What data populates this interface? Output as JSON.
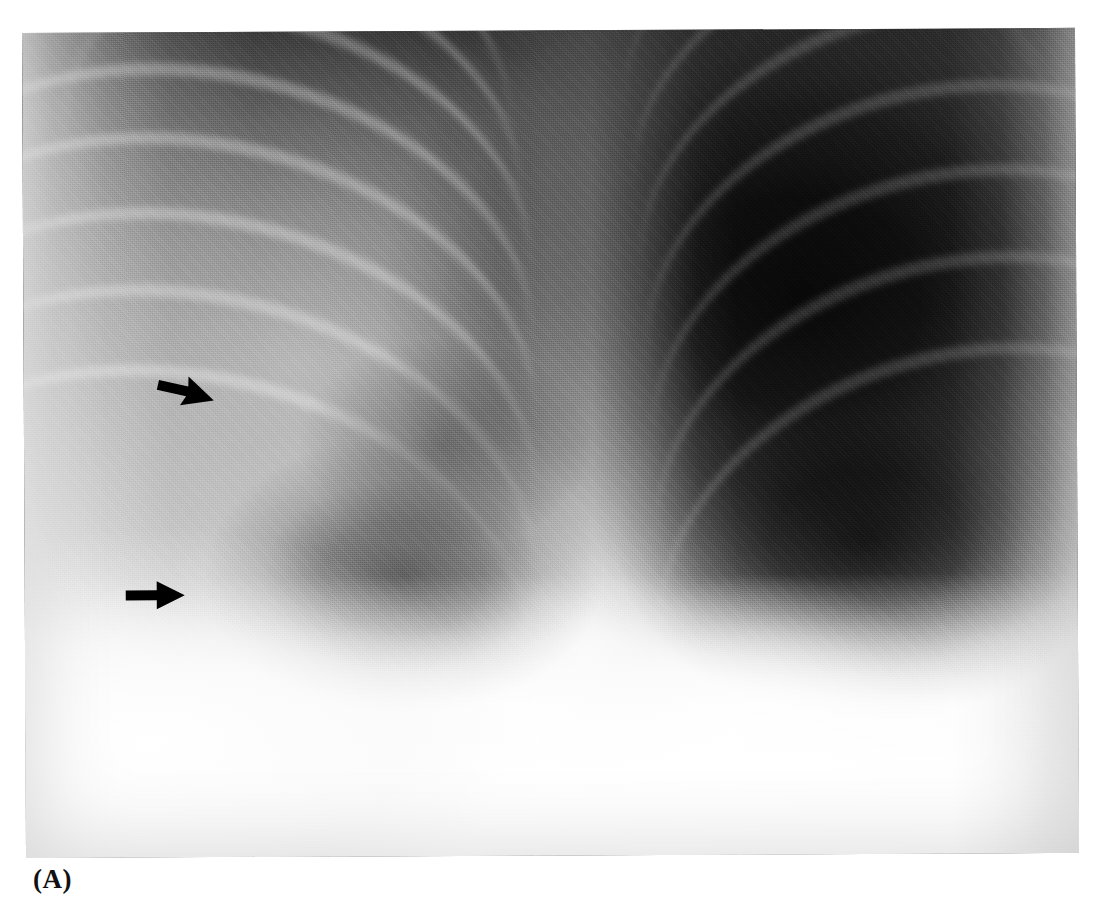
{
  "figure": {
    "panel_label": "(A)",
    "modality": "chest-radiograph",
    "view": "frontal-pa-coned"
  },
  "image_plate": {
    "left": 22,
    "top": 33,
    "width": 1053,
    "height": 825,
    "rotation_deg": -0.28,
    "background": "#585858"
  },
  "tones": {
    "film_white": "#ffffff",
    "page_background": "#ffffff",
    "apex_dark": "#3a3a3a",
    "hyperlucent_lung": "#050505",
    "mediastinum_bright": "#f2f2f2",
    "diaphragm_white": "#fbfbfb",
    "annotation_black": "#000000",
    "caption_color": "#111111"
  },
  "annotations": {
    "arrows": [
      {
        "name": "upper-arrow",
        "label": "upper annotation arrow",
        "direction": "right-down",
        "x": 152,
        "y": 380,
        "width": 56,
        "height": 34,
        "angle_deg": 14,
        "color": "#000000"
      },
      {
        "name": "lower-arrow",
        "label": "lower annotation arrow",
        "direction": "right",
        "x": 121,
        "y": 585,
        "width": 58,
        "height": 26,
        "angle_deg": 0,
        "color": "#000000"
      }
    ]
  },
  "anatomy_regions": [
    {
      "name": "right-lung-field",
      "side": "image-left",
      "density": "normal-to-increased"
    },
    {
      "name": "left-lung-field",
      "side": "image-right",
      "density": "markedly-hyperlucent"
    },
    {
      "name": "mediastinum-and-spine",
      "side": "centre",
      "density": "opaque-bright"
    },
    {
      "name": "cardiac-silhouette",
      "side": "image-centre-left",
      "density": "soft-tissue"
    },
    {
      "name": "right-hemidiaphragm",
      "side": "image-right-lower",
      "density": "opaque-bright"
    },
    {
      "name": "sub-diaphragmatic-abdomen",
      "side": "inferior",
      "density": "white-out"
    },
    {
      "name": "lateral-chest-wall",
      "side": "image-left-margin",
      "density": "soft-tissue-bright"
    }
  ],
  "ribs": {
    "right_anterior_count": 8,
    "left_posterior_count": 7,
    "appearance": "thin bright curvilinear bands sloping infero-laterally"
  }
}
